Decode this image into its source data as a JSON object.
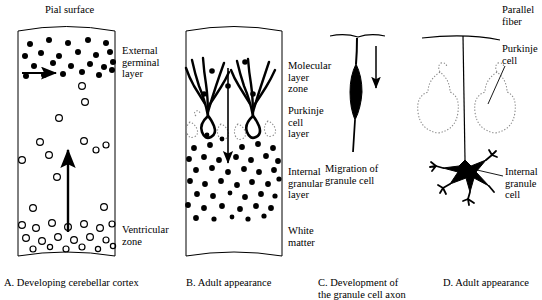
{
  "figure": {
    "title_top_label": "Pial surface",
    "background_color": "#ffffff",
    "ink_color": "#000000",
    "dotted_cell_color": "#8a8a8a"
  },
  "panels": [
    {
      "id": "A",
      "caption": "A. Developing cerebellar cortex",
      "labels": [
        {
          "name": "external-germinal-layer",
          "text": "External\ngerminal\nlayer"
        },
        {
          "name": "ventricular-zone",
          "text": "Ventricular\nzone"
        }
      ],
      "arrows": [
        {
          "name": "tangential-migration-arrow",
          "direction": "right"
        },
        {
          "name": "radial-migration-arrow",
          "direction": "up"
        }
      ],
      "filled_cells_count": 23,
      "open_cells_count": 31
    },
    {
      "id": "B",
      "caption": "B. Adult appearance",
      "labels": [
        {
          "name": "molecular-layer-zone",
          "text": "Molecular\nlayer\nzone"
        },
        {
          "name": "purkinje-cell-layer",
          "text": "Purkinje\ncell\nlayer"
        },
        {
          "name": "internal-granular-layer",
          "text": "Internal\ngranular\nlayer"
        },
        {
          "name": "white-matter",
          "text": "White\nmatter"
        }
      ],
      "arrows": [
        {
          "name": "granule-cell-descent-arrow",
          "direction": "down"
        }
      ],
      "purkinje_cells_count": 2,
      "ghost_cells_count": 5,
      "granule_cells_count": 45
    },
    {
      "id": "C",
      "caption": "C. Development of\nthe granule cell axon",
      "labels": [
        {
          "name": "migration-of-granule-cell",
          "text": "Migration of\ngranule cell"
        }
      ],
      "arrows": [
        {
          "name": "migration-direction-arrow",
          "direction": "down"
        }
      ]
    },
    {
      "id": "D",
      "caption": "D. Adult appearance",
      "labels": [
        {
          "name": "parallel-fiber",
          "text": "Parallel\nfiber"
        },
        {
          "name": "purkinje-cell",
          "text": "Purkinje\ncell"
        },
        {
          "name": "internal-granule-cell",
          "text": "Internal\ngranule\ncell"
        }
      ],
      "ghost_cells_count": 2
    }
  ]
}
